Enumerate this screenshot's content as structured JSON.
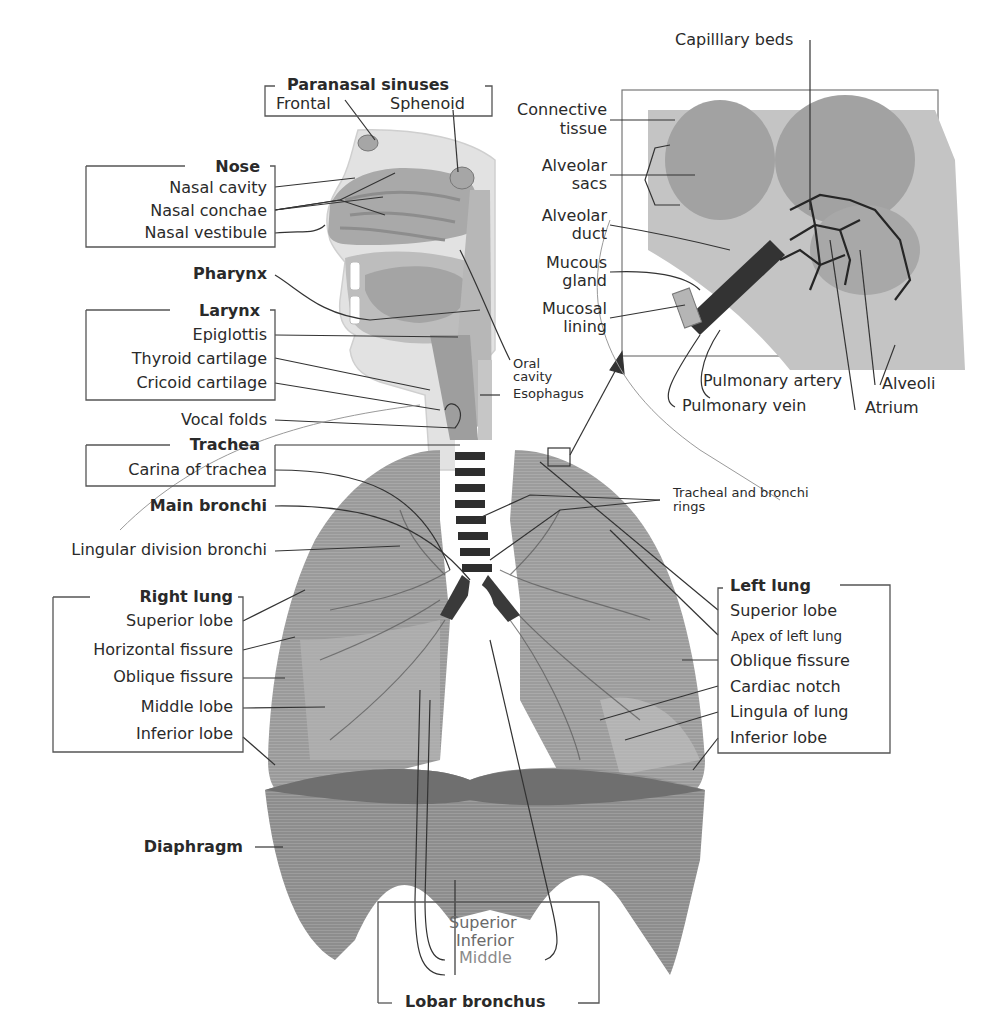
{
  "diagram": {
    "colors": {
      "tissue_light": "#c9c9c9",
      "tissue_mid": "#a8a8a8",
      "tissue_dark": "#8a8a8a",
      "line": "#333333",
      "text": "#2a2a2a"
    }
  },
  "labels": {
    "paranasal_sinuses": {
      "title": "Paranasal sinuses",
      "frontal": "Frontal",
      "sphenoid": "Sphenoid"
    },
    "nose": {
      "title": "Nose",
      "items": [
        "Nasal cavity",
        "Nasal conchae",
        "Nasal vestibule"
      ]
    },
    "pharynx": "Pharynx",
    "larynx": {
      "title": "Larynx",
      "items": [
        "Epiglottis",
        "Thyroid cartilage",
        "Cricoid cartilage"
      ]
    },
    "vocal_folds": "Vocal folds",
    "trachea": {
      "title": "Trachea",
      "items": [
        "Carina of trachea"
      ]
    },
    "main_bronchi": "Main bronchi",
    "lingular_division_bronchi": "Lingular division bronchi",
    "right_lung": {
      "title": "Right lung",
      "items": [
        "Superior lobe",
        "Horizontal fissure",
        "Oblique fissure",
        "Middle lobe",
        "Inferior lobe"
      ]
    },
    "diaphragm": "Diaphragm",
    "lobar_bronchus": {
      "title": "Lobar bronchus",
      "items": [
        "Superior",
        "Inferior",
        "Middle"
      ]
    },
    "oral_cavity": [
      "Oral",
      "cavity"
    ],
    "esophagus": "Esophagus",
    "tracheal_rings": [
      "Tracheal and bronchi",
      "rings"
    ],
    "left_lung": {
      "title": "Left lung",
      "items": [
        "Superior lobe",
        "Apex of left lung",
        "Oblique fissure",
        "Cardiac notch",
        "Lingula of lung",
        "Inferior lobe"
      ]
    },
    "inset": {
      "capillary_beds": "Capilllary beds",
      "left": [
        [
          "Connective",
          "tissue"
        ],
        [
          "Alveolar",
          "sacs"
        ],
        [
          "Alveolar",
          "duct"
        ],
        [
          "Mucous",
          "gland"
        ],
        [
          "Mucosal",
          "lining"
        ]
      ],
      "pulmonary_artery": "Pulmonary artery",
      "pulmonary_vein": "Pulmonary vein",
      "alveoli": "Alveoli",
      "atrium": "Atrium"
    }
  }
}
